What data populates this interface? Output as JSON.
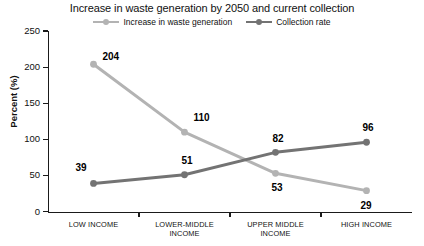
{
  "chart_data": {
    "type": "line",
    "title": "Increase in waste generation by 2050 and current collection",
    "xlabel": "",
    "ylabel": "Percent (%)",
    "ylim": [
      0,
      250
    ],
    "ytick_labels": [
      "0",
      "50",
      "100",
      "150",
      "200",
      "250"
    ],
    "yticks": [
      0,
      50,
      100,
      150,
      200,
      250
    ],
    "grid": false,
    "legend_position": "top-center",
    "categories": [
      "LOW INCOME",
      "LOWER-MIDDLE INCOME",
      "UPPER MIDDLE INCOME",
      "HIGH INCOME"
    ],
    "category_lines": [
      [
        "LOW INCOME"
      ],
      [
        "LOWER-MIDDLE",
        "INCOME"
      ],
      [
        "UPPER MIDDLE",
        "INCOME"
      ],
      [
        "HIGH INCOME"
      ]
    ],
    "series": [
      {
        "name": "Increase in waste generation",
        "color": "#b3b3b3",
        "values": [
          204,
          110,
          53,
          29
        ],
        "labels": [
          "204",
          "110",
          "53",
          "29"
        ]
      },
      {
        "name": "Collection rate",
        "color": "#737373",
        "values": [
          39,
          51,
          82,
          96
        ],
        "labels": [
          "39",
          "51",
          "82",
          "96"
        ]
      }
    ]
  },
  "legend": {
    "items": [
      {
        "label": "Increase in waste generation",
        "color": "#b3b3b3"
      },
      {
        "label": "Collection rate",
        "color": "#737373"
      }
    ]
  },
  "axes": {
    "y_title": "Percent (%)"
  }
}
